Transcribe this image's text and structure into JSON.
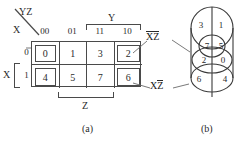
{
  "figure": {
    "caption_a": "(a)",
    "caption_b": "(b)"
  },
  "kmap": {
    "corner_top_label": "YZ",
    "corner_bottom_label": "X",
    "column_headers": [
      "00",
      "01",
      "11",
      "10"
    ],
    "row_headers": [
      "0",
      "1"
    ],
    "variable_brace_top": "Y",
    "variable_brace_left": "X",
    "variable_brace_bottom": "Z",
    "cells": [
      {
        "value": "0",
        "boxed": true
      },
      {
        "value": "1",
        "boxed": false
      },
      {
        "value": "3",
        "boxed": false
      },
      {
        "value": "2",
        "boxed": true
      },
      {
        "value": "4",
        "boxed": true
      },
      {
        "value": "5",
        "boxed": false
      },
      {
        "value": "7",
        "boxed": false
      },
      {
        "value": "6",
        "boxed": true
      }
    ],
    "annotations": [
      {
        "name": "not-x-not-z",
        "first": "X",
        "second": "Z",
        "first_bar": true,
        "second_bar": true
      },
      {
        "name": "x-not-z",
        "first": "X",
        "second": "Z",
        "first_bar": false,
        "second_bar": true
      }
    ]
  },
  "venn": {
    "regions": [
      {
        "id": "r3",
        "value": "3"
      },
      {
        "id": "r1",
        "value": "1"
      },
      {
        "id": "r7",
        "value": "7"
      },
      {
        "id": "r5",
        "value": "5"
      },
      {
        "id": "r2",
        "value": "2"
      },
      {
        "id": "r0",
        "value": "0"
      },
      {
        "id": "r6",
        "value": "6"
      },
      {
        "id": "r4",
        "value": "4"
      }
    ]
  },
  "colors": {
    "line": "#4a4a4a",
    "text": "#2a2a2a",
    "background": "#ffffff"
  }
}
